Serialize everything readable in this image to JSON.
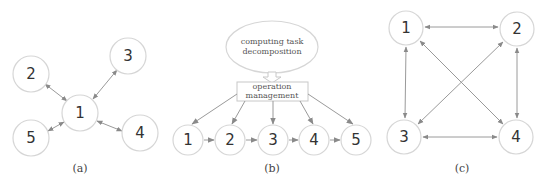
{
  "panels": {
    "a": {
      "caption": "(a)",
      "topology": "star",
      "nodes": [
        {
          "id": "1",
          "label": "1",
          "x": 80,
          "y": 113,
          "r": 18
        },
        {
          "id": "2",
          "label": "2",
          "x": 31,
          "y": 74,
          "r": 18
        },
        {
          "id": "3",
          "label": "3",
          "x": 128,
          "y": 56,
          "r": 18
        },
        {
          "id": "4",
          "label": "4",
          "x": 140,
          "y": 133,
          "r": 18
        },
        {
          "id": "5",
          "label": "5",
          "x": 31,
          "y": 138,
          "r": 18
        }
      ],
      "edges": [
        {
          "from": "1",
          "to": "2",
          "bidirectional": true
        },
        {
          "from": "1",
          "to": "3",
          "bidirectional": true
        },
        {
          "from": "1",
          "to": "4",
          "bidirectional": true
        },
        {
          "from": "1",
          "to": "5",
          "bidirectional": true
        }
      ]
    },
    "b": {
      "caption": "(b)",
      "topology": "pipeline",
      "decomposition_label_line1": "computing task",
      "decomposition_label_line2": "decomposition",
      "management_label_line1": "operation",
      "management_label_line2": "management",
      "nodes": [
        {
          "id": "1",
          "label": "1",
          "x": 188,
          "y": 140,
          "r": 15
        },
        {
          "id": "2",
          "label": "2",
          "x": 230,
          "y": 140,
          "r": 15
        },
        {
          "id": "3",
          "label": "3",
          "x": 273,
          "y": 140,
          "r": 15
        },
        {
          "id": "4",
          "label": "4",
          "x": 314,
          "y": 140,
          "r": 15
        },
        {
          "id": "5",
          "label": "5",
          "x": 356,
          "y": 140,
          "r": 15
        }
      ],
      "edges": [
        {
          "from": "1",
          "to": "2",
          "bidirectional": false
        },
        {
          "from": "2",
          "to": "3",
          "bidirectional": false
        },
        {
          "from": "3",
          "to": "4",
          "bidirectional": false
        },
        {
          "from": "4",
          "to": "5",
          "bidirectional": false
        }
      ]
    },
    "c": {
      "caption": "(c)",
      "topology": "fully-connected",
      "nodes": [
        {
          "id": "1",
          "label": "1",
          "x": 406,
          "y": 28,
          "r": 17
        },
        {
          "id": "2",
          "label": "2",
          "x": 517,
          "y": 29,
          "r": 17
        },
        {
          "id": "3",
          "label": "3",
          "x": 404,
          "y": 137,
          "r": 17
        },
        {
          "id": "4",
          "label": "4",
          "x": 516,
          "y": 137,
          "r": 17
        }
      ],
      "edges": [
        {
          "from": "1",
          "to": "2",
          "bidirectional": true
        },
        {
          "from": "1",
          "to": "3",
          "bidirectional": true
        },
        {
          "from": "1",
          "to": "4",
          "bidirectional": true
        },
        {
          "from": "2",
          "to": "3",
          "bidirectional": true
        },
        {
          "from": "2",
          "to": "4",
          "bidirectional": true
        },
        {
          "from": "3",
          "to": "4",
          "bidirectional": true
        }
      ]
    }
  },
  "colors": {
    "node_stroke": "#d6d6d6",
    "edge": "#9a9a9a",
    "text": "#333333"
  }
}
